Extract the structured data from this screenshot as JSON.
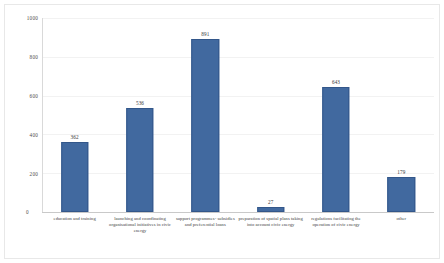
{
  "chart_data": {
    "type": "bar",
    "title": "",
    "xlabel": "",
    "ylabel": "",
    "ylim": [
      0,
      1000
    ],
    "grid": true,
    "legend": "none",
    "bar_color": "#41699f",
    "bar_border_color": "#33578a",
    "yticks": [
      1000,
      800,
      600,
      400,
      200,
      0
    ],
    "ytick_labels": [
      "1000",
      "800",
      "600",
      "400",
      "200",
      "0"
    ],
    "categories": [
      "education and training",
      "launching and coordinating organisational initiatives in civic energy",
      "support programmes- subsidies and preferential loans",
      "preparation of spatial plans taking into account civic energy",
      "regulations facilitating the operation of civic energy",
      "other"
    ],
    "values": [
      362,
      536,
      891,
      27,
      643,
      179
    ],
    "value_labels": [
      "362",
      "536",
      "891",
      "27",
      "643",
      "179"
    ]
  }
}
